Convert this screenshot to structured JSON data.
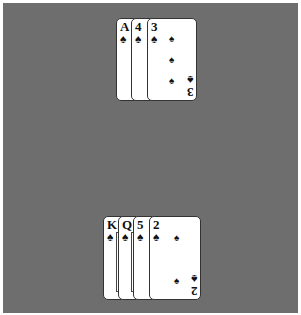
{
  "table": {
    "background_color": "#6e6e6e"
  },
  "opponent_hand": {
    "cards": [
      {
        "rank": "A",
        "suit": "♠",
        "suit_name": "spades"
      },
      {
        "rank": "4",
        "suit": "♠",
        "suit_name": "spades"
      },
      {
        "rank": "3",
        "suit": "♠",
        "suit_name": "spades"
      }
    ]
  },
  "player_hand": {
    "cards": [
      {
        "rank": "K",
        "suit": "♠",
        "suit_name": "spades"
      },
      {
        "rank": "Q",
        "suit": "♠",
        "suit_name": "spades"
      },
      {
        "rank": "5",
        "suit": "♠",
        "suit_name": "spades"
      },
      {
        "rank": "2",
        "suit": "♠",
        "suit_name": "spades"
      }
    ]
  }
}
